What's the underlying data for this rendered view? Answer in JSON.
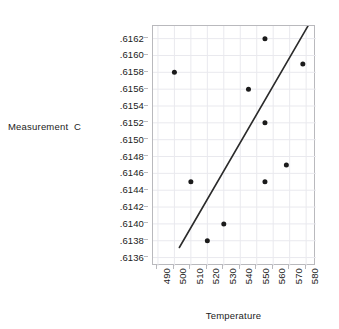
{
  "chart_data": {
    "type": "scatter",
    "title": "",
    "xlabel": "Temperature",
    "ylabel": "Measurement  C",
    "xlim": [
      487,
      586
    ],
    "ylim": [
      0.6135,
      0.61635
    ],
    "grid": true,
    "legend": null,
    "x_ticks": [
      490,
      500,
      510,
      520,
      530,
      540,
      550,
      560,
      570,
      580
    ],
    "x_tick_labels": [
      "490",
      "500",
      "510",
      "520",
      "530",
      "540",
      "550",
      "560",
      "570",
      "580"
    ],
    "y_ticks": [
      0.6136,
      0.6138,
      0.614,
      0.6142,
      0.6144,
      0.6146,
      0.6148,
      0.615,
      0.6152,
      0.6154,
      0.6156,
      0.6158,
      0.616,
      0.6162
    ],
    "y_tick_labels": [
      ".6136",
      ".6138",
      ".6140",
      ".6142",
      ".6144",
      ".6146",
      ".6148",
      ".6150",
      ".6152",
      ".6154",
      ".6156",
      ".6158",
      ".6160",
      ".6162"
    ],
    "points": [
      {
        "x": 500,
        "y": 0.6158
      },
      {
        "x": 510,
        "y": 0.6145
      },
      {
        "x": 520,
        "y": 0.6138
      },
      {
        "x": 530,
        "y": 0.614
      },
      {
        "x": 545,
        "y": 0.6156
      },
      {
        "x": 555,
        "y": 0.6162
      },
      {
        "x": 555,
        "y": 0.6152
      },
      {
        "x": 555,
        "y": 0.6145
      },
      {
        "x": 568,
        "y": 0.6147
      },
      {
        "x": 578,
        "y": 0.6159
      }
    ],
    "marker_color": "#1b1b1b",
    "marker_size": 5,
    "fit_line": {
      "x_start": 503,
      "y_start": 0.61372,
      "x_end": 582,
      "y_end": 0.61638,
      "color": "#2b2b2b",
      "width": 1.6
    },
    "grid_color": "#e9e9ee",
    "frame_color": "#b9b9bd",
    "background": "#ffffff"
  }
}
